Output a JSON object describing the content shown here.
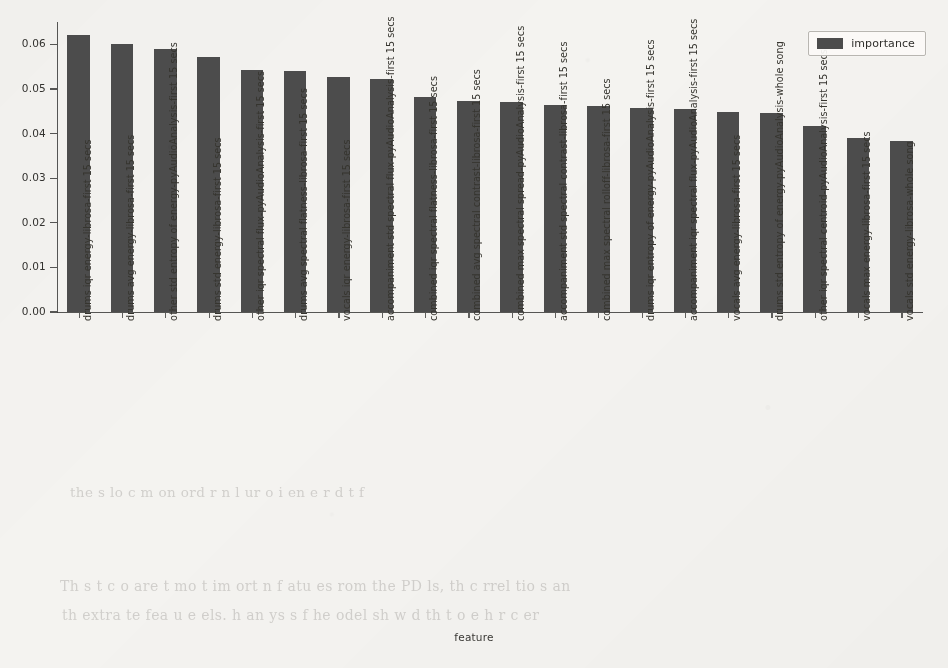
{
  "chart_data": {
    "type": "bar",
    "title": "",
    "subtitle": "",
    "xlabel": "feature",
    "ylabel": "",
    "ylim": [
      0.0,
      0.065
    ],
    "yticks": [
      0.0,
      0.01,
      0.02,
      0.03,
      0.04,
      0.05,
      0.06
    ],
    "ytick_labels": [
      "0.00",
      "0.01",
      "0.02",
      "0.03",
      "0.04",
      "0.05",
      "0.06"
    ],
    "grid": false,
    "legend_position": "upper right",
    "legend_entries": [
      "importance"
    ],
    "bar_color": "#4c4c4c",
    "background_color": "#f4f3f0",
    "categories": [
      "drums iqr energy-librosa-first 15 secs",
      "drums avg energy-librosa-first 15 secs",
      "other std entropy of energy-pyAudioAnalysis-first 15 secs",
      "drums std energy-librosa-first 15 secs",
      "other iqr spectral flux-pyAudioAnalysis-first 15 secs",
      "drums avg spectral flatness-librosa-first 15 secs",
      "vocals iqr energy-librosa-first 15 secs",
      "accompaniment std spectral flux-pyAudioAnalysis-first 15 secs",
      "combined iqr spectral flatness-librosa-first 15 secs",
      "combined avg spectral contrast-librosa-first 15 secs",
      "combined max spectral spread-pyAudioAnalysis-first 15 secs",
      "accompaniment std spectral contrast-librosa-first 15 secs",
      "combined max spectral rolloff-librosa-first 15 secs",
      "drums iqr entropy of energy-pyAudioAnalysis-first 15 secs",
      "accompaniment iqr spectral flux-pyAudioAnalysis-first 15 secs",
      "vocals avg energy-librosa-first 15 secs",
      "drums std entropy of energy-pyAudioAnalysis-whole song",
      "other iqr spectral centroid-pyAudioAnalysis-first 15 secs",
      "vocals max energy-librosa-first 15 secs",
      "vocals std energy-librosa-whole song"
    ],
    "series": [
      {
        "name": "importance",
        "values": [
          0.062,
          0.06,
          0.059,
          0.0572,
          0.0543,
          0.054,
          0.0526,
          0.0522,
          0.0481,
          0.0474,
          0.047,
          0.0465,
          0.0462,
          0.0458,
          0.0456,
          0.0449,
          0.0446,
          0.0417,
          0.039,
          0.0384
        ]
      }
    ]
  },
  "legend": {
    "label": "importance"
  },
  "axes": {
    "xlabel": "feature"
  },
  "bleed_text": {
    "line_a": "the  s  lo  c   m   on  ord  r    n       l  ur     o   i  en  e  r  d    t  f",
    "line_b": "Th   s t  c  o   are  t  mo t   im   ort  n  f  atu es   rom   the   PD  ls,  th   c rrel tio s  an",
    "line_c": "th   extra te   fea u e    els.  h   an   ys s   f   he   odel   sh w  d   th t    o  e   h r c er",
    "line_d": "t       at            h               m                    d"
  }
}
